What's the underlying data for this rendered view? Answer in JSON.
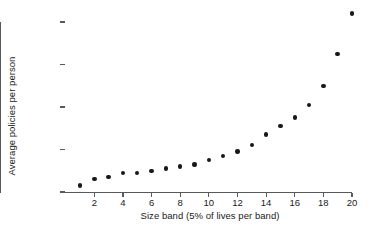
{
  "chart_data": {
    "type": "scatter",
    "title": "",
    "subtitle": "",
    "xlabel": "Size band (5% of lives per band)",
    "ylabel": "Average policies per person",
    "x": [
      1,
      2,
      3,
      4,
      5,
      6,
      7,
      8,
      9,
      10,
      11,
      12,
      13,
      14,
      15,
      16,
      17,
      18,
      19,
      20
    ],
    "values": [
      1.03,
      1.06,
      1.07,
      1.09,
      1.09,
      1.1,
      1.11,
      1.12,
      1.13,
      1.15,
      1.17,
      1.19,
      1.22,
      1.27,
      1.31,
      1.35,
      1.41,
      1.5,
      1.65,
      1.84
    ],
    "series": [
      {
        "name": "Average policies per person",
        "values": [
          1.03,
          1.06,
          1.07,
          1.09,
          1.09,
          1.1,
          1.11,
          1.12,
          1.13,
          1.15,
          1.17,
          1.19,
          1.22,
          1.27,
          1.31,
          1.35,
          1.41,
          1.5,
          1.65,
          1.84
        ]
      }
    ],
    "xlim": [
      0.4,
      20.6
    ],
    "ylim": [
      1.0,
      1.8
    ],
    "xticks": [
      2,
      4,
      6,
      8,
      10,
      12,
      14,
      16,
      18,
      20
    ],
    "xtick_labels": [
      "2",
      "4",
      "6",
      "8",
      "10",
      "12",
      "14",
      "16",
      "18",
      "20"
    ],
    "yticks": [
      1.0,
      1.2,
      1.4,
      1.6,
      1.8
    ],
    "ytick_labels": [
      "1.0",
      "1.2",
      "1.4",
      "1.6",
      "1.8"
    ],
    "grid": false,
    "legend": false,
    "legend_position": "none",
    "marker": "filled-circle",
    "marker_color": "#16181a",
    "axis_color": "#555a5e",
    "background_color": "#ffffff",
    "text_color": "#1a1a1a"
  }
}
